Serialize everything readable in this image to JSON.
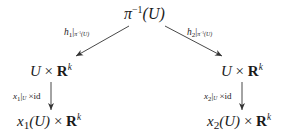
{
  "diagram": {
    "type": "commutative-diagram",
    "nodes": {
      "top": {
        "base": "π",
        "sup": "−1",
        "arg": "(U)",
        "text": "π^{-1}(U)"
      },
      "left_middle": {
        "text": "U × R^k",
        "left": "U",
        "times": "×",
        "bold": "R",
        "sup": "k"
      },
      "right_middle": {
        "text": "U × R^k",
        "left": "U",
        "times": "×",
        "bold": "R",
        "sup": "k"
      },
      "left_bottom": {
        "text": "x_1(U) × R^k",
        "var": "x",
        "sub": "1",
        "arg": "(U)",
        "times": "×",
        "bold": "R",
        "sup": "k"
      },
      "right_bottom": {
        "text": "x_2(U) × R^k",
        "var": "x",
        "sub": "2",
        "arg": "(U)",
        "times": "×",
        "bold": "R",
        "sup": "k"
      }
    },
    "edges": {
      "top_to_left": {
        "label": "h_1|_{π^{-1}(U)}",
        "fn": "h",
        "fn_sub": "1",
        "bar": "|",
        "restr_base": "π",
        "restr_sup": "−1",
        "restr_arg": "(U)"
      },
      "top_to_right": {
        "label": "h_2|_{π^{-1}(U)}",
        "fn": "h",
        "fn_sub": "2",
        "bar": "|",
        "restr_base": "π",
        "restr_sup": "−1",
        "restr_arg": "(U)"
      },
      "left_down": {
        "label": "x_1|_U × id",
        "fn": "x",
        "fn_sub": "1",
        "bar": "|",
        "restr": "U",
        "times": "×",
        "id": "id"
      },
      "right_down": {
        "label": "x_2|_U × id",
        "fn": "x",
        "fn_sub": "2",
        "bar": "|",
        "restr": "U",
        "times": "×",
        "id": "id"
      }
    },
    "colors": {
      "ink": "#1a1a1a",
      "arrow": "#333333",
      "background": "#ffffff"
    }
  }
}
